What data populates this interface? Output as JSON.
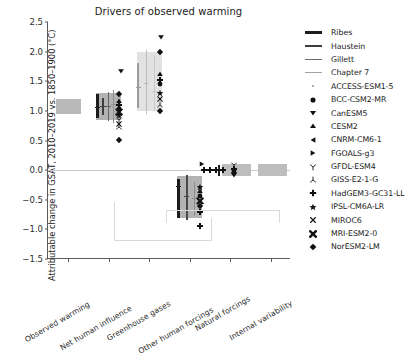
{
  "chart_data": {
    "type": "scatter",
    "title": "Drivers of observed warming",
    "xlabel": "",
    "ylabel": "Attributable change in GSAT, 2010–2019 vs. 1850–1900 (°C)",
    "ylim": [
      -1.5,
      2.5
    ],
    "yticks": [
      -1.5,
      -1.0,
      -0.5,
      0.0,
      0.5,
      1.0,
      1.5,
      2.0,
      2.5
    ],
    "ytick_labels": [
      "−1.5",
      "−1.0",
      "−0.5",
      "0.0",
      "0.5",
      "1.0",
      "1.5",
      "2.0",
      "2.5"
    ],
    "grid": false,
    "zero_line": 0.0,
    "legend_position": "right outside",
    "categories": [
      "Observed warming",
      "Net human influence",
      "Greenhouse gases",
      "Other human forcings",
      "Natural forcings",
      "Internal variability"
    ],
    "assessment_bands": [
      {
        "category": "Observed warming",
        "low": 0.95,
        "high": 1.2,
        "color": "#b9b9b9"
      },
      {
        "category": "Net human influence",
        "low": 0.85,
        "high": 1.3,
        "color": "#b3b3b3"
      },
      {
        "category": "Greenhouse gases",
        "low": 1.0,
        "high": 2.0,
        "color": "#e2e2e2"
      },
      {
        "category": "Other human forcings",
        "low": -0.8,
        "high": -0.1,
        "color": "#b3b3b3"
      },
      {
        "category": "Natural forcings",
        "low": -0.1,
        "high": 0.1,
        "color": "#bdbdbd"
      },
      {
        "category": "Internal variability",
        "low": -0.1,
        "high": 0.1,
        "color": "#bdbdbd"
      }
    ],
    "study_ranges": [
      {
        "category": "Net human influence",
        "study": "Ribes",
        "low": 0.88,
        "high": 1.28,
        "best": 1.05,
        "color": "#1c1c1c",
        "width": 2.6
      },
      {
        "category": "Net human influence",
        "study": "Haustein",
        "low": 0.93,
        "high": 1.22,
        "best": 1.07,
        "color": "#3d3d3d",
        "width": 2.2
      },
      {
        "category": "Net human influence",
        "study": "Gillett",
        "low": 0.83,
        "high": 1.32,
        "best": 1.08,
        "color": "#666666",
        "width": 1.5
      },
      {
        "category": "Net human influence",
        "study": "Chapter 7",
        "low": 0.8,
        "high": 1.35,
        "best": 1.1,
        "color": "#8f8f8f",
        "width": 1.0
      },
      {
        "category": "Greenhouse gases",
        "study": "Ribes",
        "low": 1.05,
        "high": 1.8,
        "best": 1.4,
        "color": "#9b9b9b",
        "width": 2.6
      },
      {
        "category": "Greenhouse gases",
        "study": "Gillett",
        "low": 0.95,
        "high": 2.02,
        "best": 1.47,
        "color": "#bcbcbc",
        "width": 1.5
      },
      {
        "category": "Greenhouse gases",
        "study": "Chapter 7",
        "low": 1.0,
        "high": 1.95,
        "best": 1.33,
        "color": "#c9c9c9",
        "width": 1.0
      },
      {
        "category": "Other human forcings",
        "study": "Ribes",
        "low": -0.8,
        "high": -0.15,
        "best": -0.27,
        "color": "#1c1c1c",
        "width": 2.6
      },
      {
        "category": "Other human forcings",
        "study": "Gillett",
        "low": -0.85,
        "high": -0.08,
        "best": -0.44,
        "color": "#4a4a4a",
        "width": 1.5
      },
      {
        "category": "Other human forcings",
        "study": "Chapter 7",
        "low": -0.78,
        "high": -0.2,
        "best": -0.48,
        "color": "#8c8c8c",
        "width": 1.0
      },
      {
        "category": "Natural forcings",
        "study": "Ribes",
        "low": -0.1,
        "high": 0.08,
        "best": 0.0,
        "color": "#1c1c1c",
        "width": 2.6
      }
    ],
    "models": [
      {
        "name": "ACCESS-ESM1-5",
        "marker": "point"
      },
      {
        "name": "BCC-CSM2-MR",
        "marker": "circle"
      },
      {
        "name": "CanESM5",
        "marker": "triangle-down"
      },
      {
        "name": "CESM2",
        "marker": "triangle-up"
      },
      {
        "name": "CNRM-CM6-1",
        "marker": "triangle-left"
      },
      {
        "name": "FGOALS-g3",
        "marker": "triangle-right"
      },
      {
        "name": "GFDL-ESM4",
        "marker": "tri-down"
      },
      {
        "name": "GISS-E2-1-G",
        "marker": "tri-up"
      },
      {
        "name": "HadGEM3-GC31-LL",
        "marker": "plus-filled"
      },
      {
        "name": "IPSL-CM6A-LR",
        "marker": "star"
      },
      {
        "name": "MIROC6",
        "marker": "x"
      },
      {
        "name": "MRI-ESM2-0",
        "marker": "x-filled"
      },
      {
        "name": "NorESM2-LM",
        "marker": "diamond"
      }
    ],
    "legend_lines": [
      {
        "label": "Ribes",
        "color": "#1c1c1c",
        "width": 3.0
      },
      {
        "label": "Haustein",
        "color": "#3d3d3d",
        "width": 2.4
      },
      {
        "label": "Gillett",
        "color": "#6b6b6b",
        "width": 1.6
      },
      {
        "label": "Chapter 7",
        "color": "#a3a3a3",
        "width": 1.0
      }
    ],
    "model_points": [
      {
        "category": "Net human influence",
        "model": "CanESM5",
        "value": 1.67,
        "marker": "triangle-down",
        "offset": 0.3
      },
      {
        "category": "Net human influence",
        "model": "NorESM2-LM",
        "value": 1.28,
        "marker": "diamond",
        "offset": 0.26
      },
      {
        "category": "Net human influence",
        "model": "CESM2",
        "value": 1.17,
        "marker": "triangle-up",
        "offset": 0.26
      },
      {
        "category": "Net human influence",
        "model": "HadGEM3-GC31-LL",
        "value": 1.1,
        "marker": "plus-filled",
        "offset": 0.26
      },
      {
        "category": "Net human influence",
        "model": "BCC-CSM2-MR",
        "value": 1.03,
        "marker": "circle",
        "offset": 0.26
      },
      {
        "category": "Net human influence",
        "model": "MRI-ESM2-0",
        "value": 0.98,
        "marker": "x-filled",
        "offset": 0.26
      },
      {
        "category": "Net human influence",
        "model": "IPSL-CM6A-LR",
        "value": 0.93,
        "marker": "star",
        "offset": 0.26
      },
      {
        "category": "Net human influence",
        "model": "ACCESS-ESM1-5",
        "value": 0.89,
        "marker": "point",
        "offset": 0.26
      },
      {
        "category": "Net human influence",
        "model": "GFDL-ESM4",
        "value": 0.84,
        "marker": "tri-down",
        "offset": 0.26
      },
      {
        "category": "Net human influence",
        "model": "MIROC6",
        "value": 0.78,
        "marker": "x",
        "offset": 0.26
      },
      {
        "category": "Net human influence",
        "model": "GISS-E2-1-G",
        "value": 0.72,
        "marker": "tri-up",
        "offset": 0.26
      },
      {
        "category": "Net human influence",
        "model": "NorESM2-LM",
        "value": 0.51,
        "marker": "diamond",
        "offset": 0.26
      },
      {
        "category": "Greenhouse gases",
        "model": "CanESM5",
        "value": 2.24,
        "marker": "triangle-down",
        "offset": 0.3
      },
      {
        "category": "Greenhouse gases",
        "model": "NorESM2-LM",
        "value": 2.0,
        "marker": "diamond",
        "offset": 0.26
      },
      {
        "category": "Greenhouse gases",
        "model": "CESM2",
        "value": 1.62,
        "marker": "triangle-up",
        "offset": 0.26
      },
      {
        "category": "Greenhouse gases",
        "model": "HadGEM3-GC31-LL",
        "value": 1.52,
        "marker": "plus-filled",
        "offset": 0.26
      },
      {
        "category": "Greenhouse gases",
        "model": "BCC-CSM2-MR",
        "value": 1.45,
        "marker": "circle",
        "offset": 0.26
      },
      {
        "category": "Greenhouse gases",
        "model": "IPSL-CM6A-LR",
        "value": 1.3,
        "marker": "star",
        "offset": 0.26
      },
      {
        "category": "Greenhouse gases",
        "model": "MIROC6",
        "value": 1.2,
        "marker": "x",
        "offset": 0.26
      },
      {
        "category": "Greenhouse gases",
        "model": "GISS-E2-1-G",
        "value": 1.1,
        "marker": "tri-up",
        "offset": 0.26
      },
      {
        "category": "Greenhouse gases",
        "model": "NorESM2-LM",
        "value": 1.0,
        "marker": "diamond",
        "offset": 0.26
      },
      {
        "category": "Other human forcings",
        "model": "FGOALS-g3",
        "value": 0.11,
        "marker": "triangle-right",
        "offset": 0.3
      },
      {
        "category": "Other human forcings",
        "model": "IPSL-CM6A-LR",
        "value": -0.28,
        "marker": "star",
        "offset": 0.26
      },
      {
        "category": "Other human forcings",
        "model": "CESM2",
        "value": -0.36,
        "marker": "triangle-up",
        "offset": 0.26
      },
      {
        "category": "Other human forcings",
        "model": "BCC-CSM2-MR",
        "value": -0.44,
        "marker": "circle",
        "offset": 0.26
      },
      {
        "category": "Other human forcings",
        "model": "MRI-ESM2-0",
        "value": -0.52,
        "marker": "x-filled",
        "offset": 0.26
      },
      {
        "category": "Other human forcings",
        "model": "NorESM2-LM",
        "value": -0.6,
        "marker": "diamond",
        "offset": 0.26
      },
      {
        "category": "Other human forcings",
        "model": "HadGEM3-GC31-LL",
        "value": -0.7,
        "marker": "plus-filled",
        "offset": 0.26
      },
      {
        "category": "Other human forcings",
        "model": "HadGEM3-GC31-LL",
        "value": -0.95,
        "marker": "plus-filled",
        "offset": 0.26
      },
      {
        "category": "Natural forcings",
        "model": "GFDL-ESM4",
        "value": 0.08,
        "marker": "tri-down",
        "offset": 0.1
      },
      {
        "category": "Natural forcings",
        "model": "HadGEM3-GC31-LL",
        "value": 0.02,
        "marker": "plus-filled",
        "offset": 0.1
      },
      {
        "category": "Natural forcings",
        "model": "BCC-CSM2-MR",
        "value": -0.01,
        "marker": "circle",
        "offset": 0.1
      },
      {
        "category": "Natural forcings",
        "model": "NorESM2-LM",
        "value": -0.05,
        "marker": "diamond",
        "offset": 0.1
      },
      {
        "category": "Natural forcings",
        "model": "CanESM5",
        "value": -0.09,
        "marker": "triangle-down",
        "offset": 0.1
      },
      {
        "category": "Natural forcings",
        "model": "HadGEM3-GC31-LL",
        "value": 0.0,
        "marker": "plus-filled",
        "offset": -0.18
      },
      {
        "category": "Natural forcings",
        "model": "HadGEM3-GC31-LL",
        "value": 0.0,
        "marker": "plus-filled",
        "offset": -0.34
      },
      {
        "category": "Natural forcings",
        "model": "HadGEM3-GC31-LL",
        "value": 0.0,
        "marker": "plus-filled",
        "offset": -0.5
      },
      {
        "category": "Natural forcings",
        "model": "HadGEM3-GC31-LL",
        "value": 0.0,
        "marker": "plus-filled",
        "offset": -0.66
      }
    ]
  }
}
